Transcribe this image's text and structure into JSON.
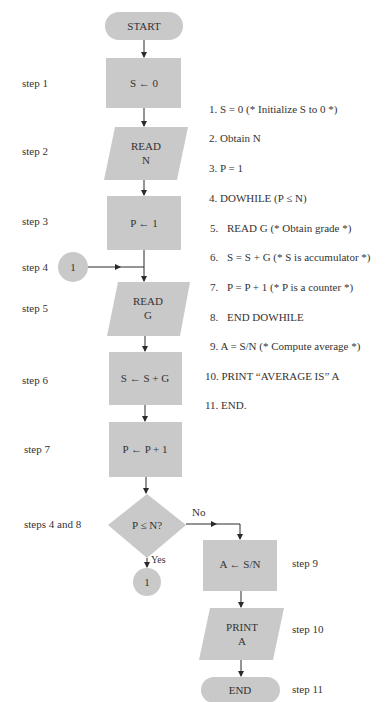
{
  "flowchart": {
    "start": "START",
    "end": "END",
    "nodes": [
      {
        "id": "s1",
        "lines": [
          "S ← 0"
        ],
        "type": "process",
        "step": "step 1"
      },
      {
        "id": "s2",
        "lines": [
          "READ",
          "N"
        ],
        "type": "io",
        "step": "step 2"
      },
      {
        "id": "s3",
        "lines": [
          "P ← 1"
        ],
        "type": "process",
        "step": "step 3"
      },
      {
        "id": "s5",
        "lines": [
          "READ",
          "G"
        ],
        "type": "io",
        "step": "step 5"
      },
      {
        "id": "s6",
        "lines": [
          "S ← S + G"
        ],
        "type": "process",
        "step": "step 6"
      },
      {
        "id": "s7",
        "lines": [
          "P ← P + 1"
        ],
        "type": "process",
        "step": "step 7"
      },
      {
        "id": "dec",
        "lines": [
          "P ≤ N?"
        ],
        "type": "decision",
        "step": "steps 4 and 8"
      },
      {
        "id": "s9",
        "lines": [
          "A ← S/N"
        ],
        "type": "process",
        "step": "step 9"
      },
      {
        "id": "s10",
        "lines": [
          "PRINT",
          "A"
        ],
        "type": "io",
        "step": "step 10"
      }
    ],
    "connector_label": "1",
    "step4_label": "step 4",
    "step11_label": "step 11",
    "yes_label": "Yes",
    "no_label": "No",
    "fill_color": "#c9c9c9",
    "line_color": "#2a2a2a"
  },
  "pseudocode": [
    {
      "num": "1.",
      "text": "S = 0 (* Initialize S to 0 *)",
      "indent": 0
    },
    {
      "num": "2.",
      "text": "Obtain N",
      "indent": 0
    },
    {
      "num": "3.",
      "text": "P = 1",
      "indent": 0
    },
    {
      "num": "4.",
      "text": "DOWHILE (P ≤ N)",
      "indent": 0
    },
    {
      "num": "5.",
      "text": "READ G (* Obtain grade *)",
      "indent": 1
    },
    {
      "num": "6.",
      "text": "S = S + G (* S is accumulator *)",
      "indent": 1
    },
    {
      "num": "7.",
      "text": "P = P + 1 (* P is a counter *)",
      "indent": 1
    },
    {
      "num": "8.",
      "text": "END DOWHILE",
      "indent": 1
    },
    {
      "num": "9.",
      "text": "A = S/N (* Compute average *)",
      "indent": 0
    },
    {
      "num": "10.",
      "text": "PRINT “AVERAGE IS” A",
      "indent": 0
    },
    {
      "num": "11.",
      "text": "END.",
      "indent": 0
    }
  ]
}
